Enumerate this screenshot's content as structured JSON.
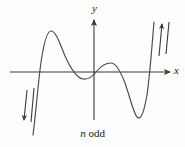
{
  "figure": {
    "caption_variable": "n",
    "caption_text": "odd",
    "caption_full": "n odd",
    "background_color": "#fdfdfb",
    "stroke_color": "#3a3a3a",
    "curve_color": "#4a4a4a"
  },
  "axes": {
    "x_label": "x",
    "y_label": "y",
    "x_axis": {
      "x1": 10,
      "y1": 72,
      "x2": 172,
      "y2": 72,
      "arrow": "right"
    },
    "y_axis": {
      "x1": 94,
      "y1": 120,
      "x2": 94,
      "y2": 18,
      "arrow": "up"
    }
  },
  "annotations": {
    "left_arrows": {
      "name": "down-arrows",
      "direction": "down",
      "count": 2,
      "x": 26,
      "y_top": 88,
      "y_bottom": 122
    },
    "right_arrows": {
      "name": "up-arrows",
      "direction": "up",
      "count": 2,
      "x": 161,
      "y_top": 22,
      "y_bottom": 56
    }
  },
  "chart_data": {
    "type": "line",
    "title": "",
    "subtitle": "n odd",
    "xlabel": "x",
    "ylabel": "y",
    "grid": false,
    "legend": null,
    "axis_origin_px": {
      "x": 94,
      "y": 72
    },
    "end_behavior": {
      "left": "down",
      "right": "up"
    },
    "x_intercepts_px": [
      38,
      85,
      94,
      104,
      150
    ],
    "extrema_px": [
      {
        "kind": "local-max",
        "x": 51,
        "y": 31
      },
      {
        "kind": "local-min",
        "x": 83,
        "y": 79
      },
      {
        "kind": "local-max",
        "x": 111,
        "y": 63
      },
      {
        "kind": "local-min",
        "x": 137,
        "y": 117
      }
    ],
    "path": "M 33,135 C 36,112 38,84 41,62 C 44,42 47,31 51,31 C 56,31 60,44 65,56 C 70,67 76,78 83,79 C 89,80 93,76 97,71 C 101,66 106,63 111,63 C 116,63 120,70 125,83 C 130,97 133,112 137,117 C 141,121 144,112 147,95 C 150,74 152,45 154,22"
  }
}
